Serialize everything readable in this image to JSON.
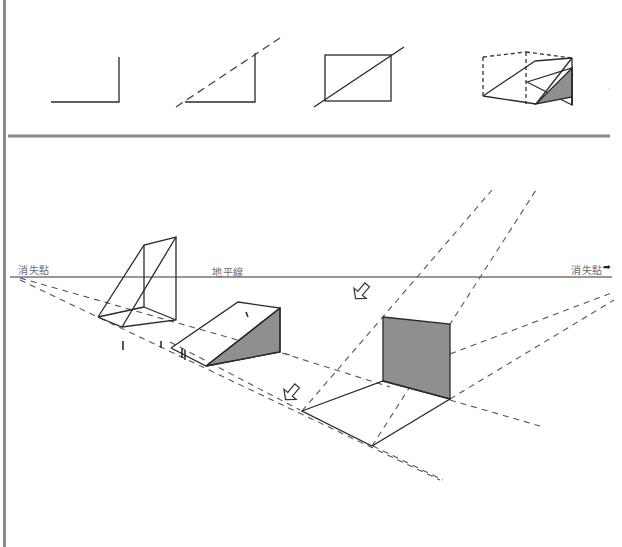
{
  "labels": {
    "vanishing_point_left": "消失點",
    "horizon_line": "地平線",
    "vanishing_point_right": "消失點",
    "right_arrow": "➡"
  },
  "top_panel": {
    "steps": [
      {
        "name": "step-1-right-angle"
      },
      {
        "name": "step-2-diagonal-extension"
      },
      {
        "name": "step-3-rectangle-diagonal"
      },
      {
        "name": "step-4-wedge-in-box"
      }
    ]
  },
  "colors": {
    "line": "#2a2a2a",
    "dashed": "#555555",
    "shade": "#8f8f8f",
    "divider": "#8a8a8a",
    "label": "#6a6a6a"
  }
}
